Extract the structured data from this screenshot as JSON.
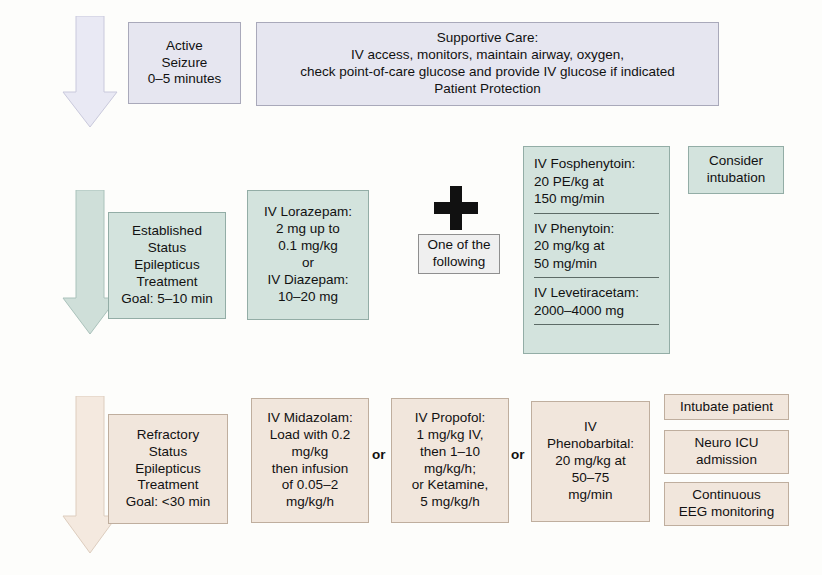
{
  "diagram": {
    "colors": {
      "acute_fill": "#e6e6f0",
      "established_fill": "#d3e3dd",
      "refractory_fill": "#f1e6dc",
      "plain_fill": "#d3e3dd",
      "text": "#111111"
    }
  },
  "tier1": {
    "arrow_name": "downward-arrow-acute",
    "stage_box": {
      "lines": [
        "Active",
        "Seizure",
        "0–5 minutes"
      ]
    },
    "supportive_care": {
      "lines": [
        "Supportive Care:",
        "IV access, monitors, maintain airway, oxygen,",
        "check point-of-care glucose and provide IV glucose if indicated",
        "Patient Protection"
      ]
    }
  },
  "tier2": {
    "arrow_name": "downward-arrow-established",
    "stage_box": {
      "lines": [
        "Established",
        "Status",
        "Epilepticus",
        "Treatment",
        "Goal: 5–10 min"
      ]
    },
    "benzodiazepine_box": {
      "lines": [
        "IV Lorazepam:",
        "2 mg up to",
        "0.1 mg/kg",
        "or",
        "IV Diazepam:",
        "10–20 mg"
      ]
    },
    "plus_symbol": "+",
    "one_of_following": {
      "lines": [
        "One of the",
        "following"
      ]
    },
    "drug_options": [
      {
        "lines": [
          "IV Fosphenytoin:",
          "20 PE/kg at",
          "150 mg/min"
        ]
      },
      {
        "lines": [
          "IV Phenytoin:",
          "20 mg/kg at",
          "50 mg/min"
        ]
      },
      {
        "lines": [
          "IV Levetiracetam:",
          "2000–4000 mg"
        ]
      }
    ],
    "consider_intubation": {
      "lines": [
        "Consider",
        "intubation"
      ]
    }
  },
  "tier3": {
    "arrow_name": "downward-arrow-refractory",
    "stage_box": {
      "lines": [
        "Refractory",
        "Status",
        "Epilepticus",
        "Treatment",
        "Goal: <30 min"
      ]
    },
    "agents": [
      {
        "lines": [
          "IV Midazolam:",
          "Load with 0.2",
          "mg/kg",
          "then infusion",
          "of 0.05–2",
          "mg/kg/h"
        ]
      },
      {
        "lines": [
          "IV Propofol:",
          "1 mg/kg IV,",
          "then 1–10",
          "mg/kg/h;",
          "or Ketamine,",
          "5 mg/kg/h"
        ]
      },
      {
        "lines": [
          "IV",
          "Phenobarbital:",
          "20 mg/kg at",
          "50–75",
          "mg/min"
        ]
      }
    ],
    "or_labels": [
      "or",
      "or"
    ],
    "supportive_actions": [
      {
        "lines": [
          "Intubate patient"
        ]
      },
      {
        "lines": [
          "Neuro ICU",
          "admission"
        ]
      },
      {
        "lines": [
          "Continuous",
          "EEG monitoring"
        ]
      }
    ]
  }
}
